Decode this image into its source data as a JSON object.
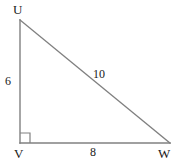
{
  "figure": {
    "kind": "right-triangle-diagram",
    "stroke_color": "#808080",
    "text_color": "#1a1a1a",
    "background_color": "#ffffff",
    "stroke_width": 1.4,
    "vertices": [
      {
        "name": "U",
        "label": "U",
        "x": 20,
        "y": 20,
        "angle_deg": 53.13
      },
      {
        "name": "V",
        "label": "V",
        "x": 20,
        "y": 143,
        "angle_deg": 90
      },
      {
        "name": "W",
        "label": "W",
        "x": 170,
        "y": 143,
        "angle_deg": 36.87
      }
    ],
    "sides": [
      {
        "name": "UV",
        "label": "6",
        "role": "leg",
        "length": 6
      },
      {
        "name": "VW",
        "label": "8",
        "role": "leg",
        "length": 8
      },
      {
        "name": "UW",
        "label": "10",
        "role": "hypotenuse",
        "length": 10
      }
    ],
    "right_angle": {
      "at_vertex": "V",
      "marker": "square",
      "size": 10
    },
    "path_points": "20,20 20,143 170,143 20,20"
  }
}
